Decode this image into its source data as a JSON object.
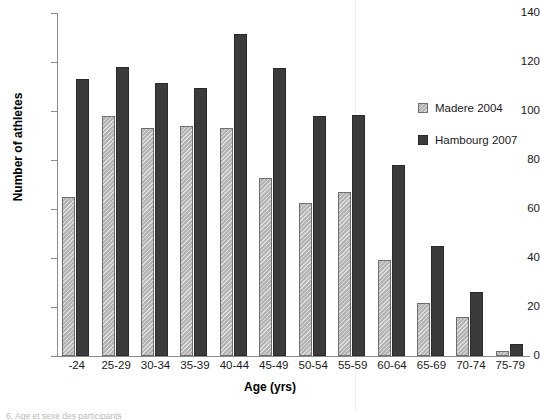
{
  "chart_data": {
    "type": "bar",
    "title": "",
    "xlabel": "Age (yrs)",
    "ylabel": "Number of athletes",
    "categories": [
      "-24",
      "25-29",
      "30-34",
      "35-39",
      "40-44",
      "45-49",
      "50-54",
      "55-59",
      "60-64",
      "65-69",
      "70-74",
      "75-79"
    ],
    "series": [
      {
        "name": "Madere 2004",
        "color": "#b4b4b4",
        "pattern": "diagonal-hatch",
        "values": [
          65,
          98,
          93,
          94,
          93,
          72.5,
          62.5,
          67,
          39,
          21.5,
          16,
          2
        ]
      },
      {
        "name": "Hambourg 2007",
        "color": "#3b3b3b",
        "pattern": "solid",
        "values": [
          113,
          118,
          111.5,
          109.5,
          131.5,
          117.5,
          98,
          98.5,
          78,
          45,
          26,
          5
        ]
      }
    ],
    "ylim": [
      0,
      140
    ],
    "ytick_values": [
      0,
      20,
      40,
      60,
      80,
      100,
      120,
      140
    ],
    "ytick_labels": [
      "0",
      "20",
      "40",
      "60",
      "80",
      "100",
      "120",
      "140"
    ],
    "grid": false,
    "legend_position": "upper-right-inside"
  },
  "legend": {
    "entries": [
      {
        "label": "Madere 2004",
        "swatch": "madere"
      },
      {
        "label": "Hambourg 2007",
        "swatch": "hambourg"
      }
    ]
  },
  "caption": {
    "text": "6. Age et sexe des participants"
  }
}
